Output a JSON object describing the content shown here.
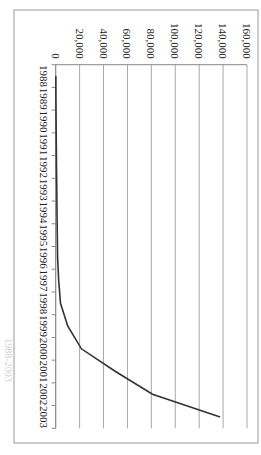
{
  "chart": {
    "title": "1988-2003",
    "orientation": "rotated-90-clockwise"
  },
  "chart_data": {
    "type": "line",
    "title": "1988-2003",
    "xlabel": "",
    "ylabel": "",
    "categories": [
      "1988",
      "1989",
      "1990",
      "1991",
      "1992",
      "1993",
      "1994",
      "1995",
      "1996",
      "1997",
      "1998",
      "1999",
      "2000",
      "2001",
      "2002",
      "2003"
    ],
    "series": [
      {
        "name": "Series 1",
        "values": [
          100,
          200,
          300,
          500,
          700,
          900,
          1100,
          1300,
          1600,
          2500,
          4000,
          10000,
          21500,
          50000,
          81000,
          137500
        ]
      }
    ],
    "ylim": [
      0,
      160000
    ],
    "yticks": [
      0,
      20000,
      40000,
      60000,
      80000,
      100000,
      120000,
      140000,
      160000
    ],
    "ytick_labels": [
      "0",
      "20,000",
      "40,000",
      "60,000",
      "80,000",
      "100,000",
      "120,000",
      "140,000",
      "160,000"
    ],
    "grid": true,
    "legend": "none",
    "line_color": "#333333"
  }
}
